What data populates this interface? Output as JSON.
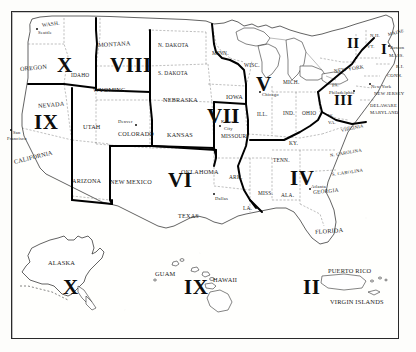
{
  "map": {
    "title": "United States Standard Federal Regions",
    "style": "scanned black-and-white line map",
    "frame_color": "#2a2a2a",
    "background_color": "#fdfdfb",
    "ink_color": "#1b1b1b",
    "region_boundary_color": "#000000",
    "state_boundary_color": "#555555"
  },
  "regions": [
    {
      "numeral": "I",
      "x": 381,
      "y": 42,
      "size": "n-small"
    },
    {
      "numeral": "II",
      "x": 347,
      "y": 36,
      "size": "n-small"
    },
    {
      "numeral": "III",
      "x": 334,
      "y": 93,
      "size": "n-small"
    },
    {
      "numeral": "IV",
      "x": 290,
      "y": 168,
      "size": "n-big"
    },
    {
      "numeral": "V",
      "x": 256,
      "y": 74,
      "size": "n-big"
    },
    {
      "numeral": "VI",
      "x": 168,
      "y": 170,
      "size": "n-big"
    },
    {
      "numeral": "VII",
      "x": 207,
      "y": 106,
      "size": "n-big"
    },
    {
      "numeral": "VIII",
      "x": 110,
      "y": 55,
      "size": "n-big"
    },
    {
      "numeral": "IX",
      "x": 34,
      "y": 112,
      "size": "n-big"
    },
    {
      "numeral": "X",
      "x": 57,
      "y": 55,
      "size": "n-big"
    }
  ],
  "inset_regions": [
    {
      "numeral": "X",
      "x": 63,
      "y": 277,
      "label": "ALASKA"
    },
    {
      "numeral": "IX",
      "x": 184,
      "y": 277,
      "label": "HAWAII"
    },
    {
      "numeral": "II",
      "x": 303,
      "y": 277,
      "label": "PUERTO RICO"
    }
  ],
  "states": [
    {
      "name": "WASH.",
      "x": 42,
      "y": 22,
      "cls": "state-sm",
      "rot": -8
    },
    {
      "name": "OREGON",
      "x": 20,
      "y": 65,
      "cls": "state",
      "rot": -5
    },
    {
      "name": "IDAHO",
      "x": 71,
      "y": 72,
      "cls": "state-sm",
      "rot": 0
    },
    {
      "name": "MONTANA",
      "x": 98,
      "y": 41,
      "cls": "state",
      "rot": -3
    },
    {
      "name": "N. DAKOTA",
      "x": 158,
      "y": 42,
      "cls": "state-sm",
      "rot": 0
    },
    {
      "name": "S. DAKOTA",
      "x": 158,
      "y": 70,
      "cls": "state-sm",
      "rot": 0
    },
    {
      "name": "MINN.",
      "x": 212,
      "y": 50,
      "cls": "state-sm",
      "rot": 0
    },
    {
      "name": "WISC.",
      "x": 244,
      "y": 62,
      "cls": "state-sm",
      "rot": 0
    },
    {
      "name": "MICH.",
      "x": 283,
      "y": 79,
      "cls": "state-sm",
      "rot": 0
    },
    {
      "name": "WYOMING",
      "x": 93,
      "y": 86,
      "cls": "state",
      "rot": 0
    },
    {
      "name": "NEBRASKA",
      "x": 163,
      "y": 96,
      "cls": "state",
      "rot": 0
    },
    {
      "name": "IOWA",
      "x": 226,
      "y": 93,
      "cls": "state",
      "rot": 0
    },
    {
      "name": "NEVADA",
      "x": 38,
      "y": 102,
      "cls": "state",
      "rot": -5
    },
    {
      "name": "UTAH",
      "x": 83,
      "y": 123,
      "cls": "state",
      "rot": 0
    },
    {
      "name": "COLORADO",
      "x": 118,
      "y": 130,
      "cls": "state",
      "rot": 0
    },
    {
      "name": "KANSAS",
      "x": 167,
      "y": 131,
      "cls": "state",
      "rot": 0
    },
    {
      "name": "MISSOURI",
      "x": 221,
      "y": 133,
      "cls": "state-sm",
      "rot": 0
    },
    {
      "name": "ILL.",
      "x": 257,
      "y": 111,
      "cls": "state-sm",
      "rot": 0
    },
    {
      "name": "IND.",
      "x": 283,
      "y": 110,
      "cls": "state-sm",
      "rot": 0
    },
    {
      "name": "OHIO",
      "x": 302,
      "y": 110,
      "cls": "state-sm",
      "rot": 0
    },
    {
      "name": "KY.",
      "x": 289,
      "y": 140,
      "cls": "state-sm",
      "rot": 0
    },
    {
      "name": "W.",
      "x": 328,
      "y": 113,
      "cls": "state-xs",
      "rot": 0
    },
    {
      "name": "VA.",
      "x": 328,
      "y": 120,
      "cls": "state-xs",
      "rot": 0
    },
    {
      "name": "VIRGINIA",
      "x": 341,
      "y": 128,
      "cls": "state-xs",
      "rot": -12
    },
    {
      "name": "PA.",
      "x": 332,
      "y": 83,
      "cls": "state-xs",
      "rot": -8
    },
    {
      "name": "NEW YORK",
      "x": 334,
      "y": 68,
      "cls": "state-sm",
      "rot": -9
    },
    {
      "name": "N.H.",
      "x": 370,
      "y": 33,
      "cls": "state-xs",
      "rot": 0
    },
    {
      "name": "MAINE",
      "x": 388,
      "y": 32,
      "cls": "state-xs",
      "rot": -14
    },
    {
      "name": "VT.",
      "x": 367,
      "y": 44,
      "cls": "state-xs",
      "rot": 0
    },
    {
      "name": "MASS.",
      "x": 389,
      "y": 53,
      "cls": "state-xs",
      "rot": 0
    },
    {
      "name": "R.I.",
      "x": 396,
      "y": 64,
      "cls": "state-xs",
      "rot": 0
    },
    {
      "name": "CONN.",
      "x": 387,
      "y": 73,
      "cls": "state-xs",
      "rot": 0
    },
    {
      "name": "NEW JERSEY",
      "x": 374,
      "y": 91,
      "cls": "state-xs",
      "rot": 0
    },
    {
      "name": "DELAWARE",
      "x": 370,
      "y": 103,
      "cls": "state-xs",
      "rot": 0
    },
    {
      "name": "MARYLAND",
      "x": 370,
      "y": 110,
      "cls": "state-xs",
      "rot": 0
    },
    {
      "name": "N. CAROLINA",
      "x": 330,
      "y": 153,
      "cls": "state-xs",
      "rot": -10
    },
    {
      "name": "S. CAROLINA",
      "x": 332,
      "y": 172,
      "cls": "state-xs",
      "rot": -8
    },
    {
      "name": "GEORGIA",
      "x": 313,
      "y": 189,
      "cls": "state-sm",
      "rot": -5
    },
    {
      "name": "TENN.",
      "x": 273,
      "y": 157,
      "cls": "state-sm",
      "rot": 0
    },
    {
      "name": "ALA.",
      "x": 281,
      "y": 192,
      "cls": "state-sm",
      "rot": 0
    },
    {
      "name": "MISS.",
      "x": 258,
      "y": 190,
      "cls": "state-sm",
      "rot": 0
    },
    {
      "name": "ARK.",
      "x": 229,
      "y": 174,
      "cls": "state-sm",
      "rot": 0
    },
    {
      "name": "LA.",
      "x": 243,
      "y": 205,
      "cls": "state-sm",
      "rot": 0
    },
    {
      "name": "FLORIDA",
      "x": 315,
      "y": 228,
      "cls": "state",
      "rot": -4
    },
    {
      "name": "OKLAHOMA",
      "x": 181,
      "y": 168,
      "cls": "state",
      "rot": 0
    },
    {
      "name": "TEXAS",
      "x": 178,
      "y": 212,
      "cls": "state",
      "rot": 0
    },
    {
      "name": "NEW MEXICO",
      "x": 110,
      "y": 178,
      "cls": "state",
      "rot": 0
    },
    {
      "name": "ARIZONA",
      "x": 72,
      "y": 177,
      "cls": "state",
      "rot": 0
    },
    {
      "name": "CALIFORNIA",
      "x": 14,
      "y": 158,
      "cls": "state",
      "rot": -14
    }
  ],
  "cities": [
    {
      "name": "Seattle",
      "x": 38,
      "y": 30,
      "dotx": 36,
      "doty": 28
    },
    {
      "name": "San",
      "x": 13,
      "y": 130,
      "dotx": 10,
      "doty": 129
    },
    {
      "name": "Francisco",
      "x": 7,
      "y": 136,
      "dotx": null,
      "doty": null
    },
    {
      "name": "Denver",
      "x": 118,
      "y": 119,
      "dotx": 135,
      "doty": 124
    },
    {
      "name": "Kansas",
      "x": 221,
      "y": 119,
      "dotx": 219,
      "doty": 125
    },
    {
      "name": "City",
      "x": 224,
      "y": 126,
      "dotx": null,
      "doty": null
    },
    {
      "name": "Chicago",
      "x": 262,
      "y": 92,
      "dotx": 259,
      "doty": 91
    },
    {
      "name": "Philadelphia",
      "x": 329,
      "y": 90,
      "dotx": 353,
      "doty": 90
    },
    {
      "name": "New York",
      "x": 371,
      "y": 84,
      "dotx": 369,
      "doty": 83
    },
    {
      "name": "Boston",
      "x": 390,
      "y": 45,
      "dotx": 388,
      "doty": 45
    },
    {
      "name": "Atlanta",
      "x": 311,
      "y": 184,
      "dotx": 309,
      "doty": 188
    },
    {
      "name": "Dallas",
      "x": 215,
      "y": 196,
      "dotx": 213,
      "doty": 193
    }
  ],
  "territories": [
    {
      "name": "ALASKA",
      "x": 48,
      "y": 259,
      "cls": "terr"
    },
    {
      "name": "GUAM",
      "x": 155,
      "y": 270,
      "cls": "terr"
    },
    {
      "name": "HAWAII",
      "x": 213,
      "y": 276,
      "cls": "terr"
    },
    {
      "name": "PUERTO RICO",
      "x": 328,
      "y": 267,
      "cls": "terr"
    },
    {
      "name": "VIRGIN ISLANDS",
      "x": 330,
      "y": 298,
      "cls": "terr"
    }
  ]
}
